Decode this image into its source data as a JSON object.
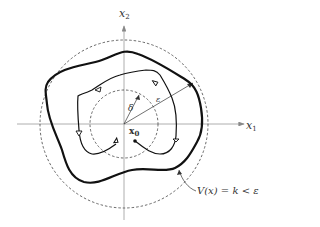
{
  "figure": {
    "axes": {
      "x1_label": "x",
      "x1_sub": "1",
      "x2_label": "x",
      "x2_sub": "2"
    },
    "labels": {
      "delta": "δ",
      "epsilon": "ε",
      "x0": "x",
      "x0_sub": "0",
      "level_set": "V(x) = k < ε"
    },
    "elements": [
      "outer-dashed-circle-epsilon",
      "inner-dashed-circle-delta",
      "level-set-contour",
      "trajectory-from-x0"
    ]
  }
}
